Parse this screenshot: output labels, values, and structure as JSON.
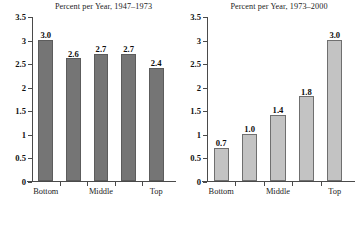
{
  "figure": {
    "background_color": "#ffffff",
    "panel_count": 2
  },
  "chart_data": [
    {
      "type": "bar",
      "title": "Percent per Year, 1947–1973",
      "xlabel": "",
      "ylabel": "",
      "categories": [
        "Bottom",
        "",
        "Middle",
        "",
        "Top"
      ],
      "tick_labels": [
        "Bottom",
        "Middle",
        "Top"
      ],
      "tick_label_bar_index": [
        0,
        2,
        4
      ],
      "values": [
        3.0,
        2.6,
        2.7,
        2.7,
        2.4
      ],
      "value_labels": [
        "3.0",
        "2.6",
        "2.7",
        "2.7",
        "2.4"
      ],
      "ylim": [
        0,
        3.5
      ],
      "yticks": [
        0,
        0.5,
        1,
        1.5,
        2,
        2.5,
        3,
        3.5
      ],
      "ytick_labels": [
        "0",
        "0.5",
        "1",
        "1.5",
        "2",
        "2.5",
        "3",
        "3.5"
      ],
      "grid": false,
      "legend": null,
      "bar_color": "#757575",
      "bar_edge_color": "#5c5c5c"
    },
    {
      "type": "bar",
      "title": "Percent per Year, 1973–2000",
      "xlabel": "",
      "ylabel": "",
      "categories": [
        "Bottom",
        "",
        "Middle",
        "",
        "Top"
      ],
      "tick_labels": [
        "Bottom",
        "Middle",
        "Top"
      ],
      "tick_label_bar_index": [
        0,
        2,
        4
      ],
      "values": [
        0.7,
        1.0,
        1.4,
        1.8,
        3.0
      ],
      "value_labels": [
        "0.7",
        "1.0",
        "1.4",
        "1.8",
        "3.0"
      ],
      "ylim": [
        0,
        3.5
      ],
      "yticks": [
        0,
        0.5,
        1,
        1.5,
        2,
        2.5,
        3,
        3.5
      ],
      "ytick_labels": [
        "0",
        "0.5",
        "1",
        "1.5",
        "2",
        "2.5",
        "3",
        "3.5"
      ],
      "grid": false,
      "legend": null,
      "bar_color": "#c3c3c3",
      "bar_edge_color": "#6f6f6f"
    }
  ]
}
